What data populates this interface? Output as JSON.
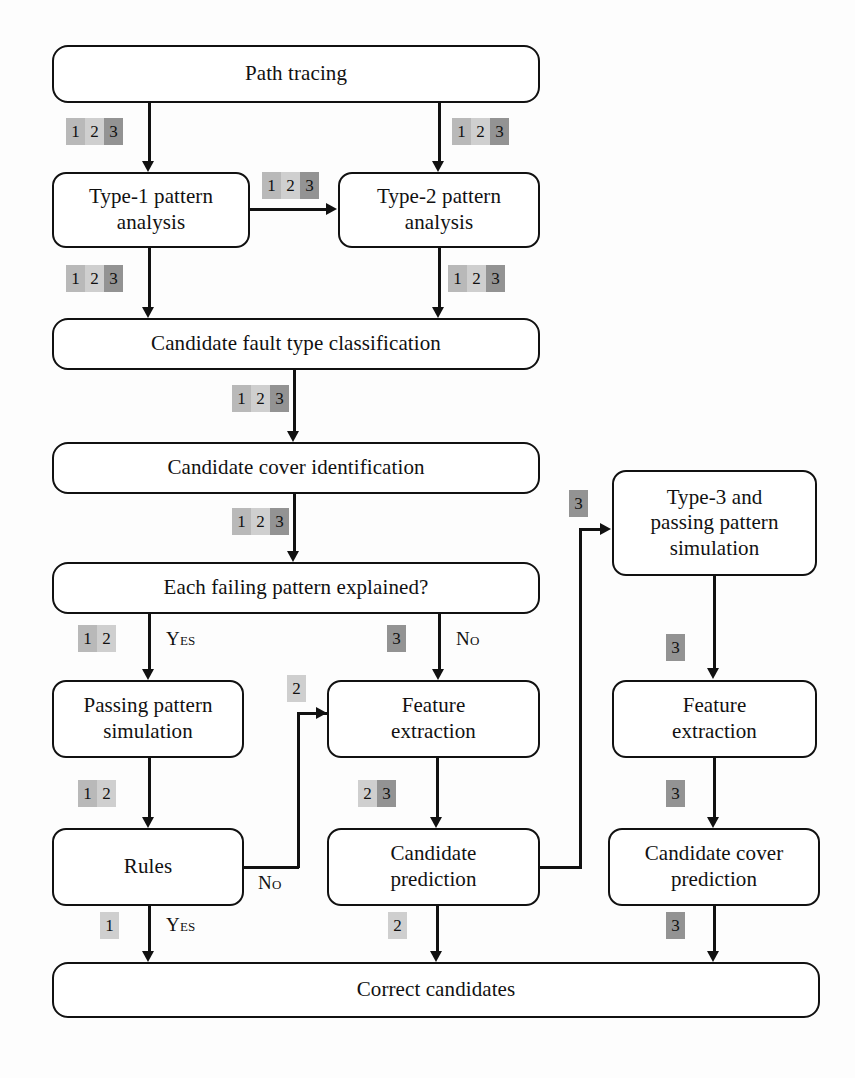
{
  "diagram": {
    "colors": {
      "badge_1": "#b9b9b9",
      "badge_2": "#cfcfcf",
      "badge_3": "#939393",
      "stroke": "#111111",
      "node_fill": "#ffffff",
      "background": "#fdfdfd"
    },
    "nodes": [
      {
        "id": "path_tracing",
        "label": "Path tracing"
      },
      {
        "id": "type1_analysis",
        "line1": "Type-1 pattern",
        "line2": "analysis"
      },
      {
        "id": "type2_analysis",
        "line1": "Type-2 pattern",
        "line2": "analysis"
      },
      {
        "id": "fault_class",
        "label": "Candidate fault type classification"
      },
      {
        "id": "cover_ident",
        "label": "Candidate cover identification"
      },
      {
        "id": "explained_q",
        "label": "Each failing pattern explained?"
      },
      {
        "id": "passing_sim",
        "line1": "Passing pattern",
        "line2": "simulation"
      },
      {
        "id": "feature_extract_mid",
        "line1": "Feature",
        "line2": "extraction"
      },
      {
        "id": "rules",
        "label": "Rules"
      },
      {
        "id": "cand_prediction",
        "line1": "Candidate",
        "line2": "prediction"
      },
      {
        "id": "type3_sim",
        "line1": "Type-3 and",
        "line2": "passing pattern",
        "line3": "simulation"
      },
      {
        "id": "feature_extract_right",
        "line1": "Feature",
        "line2": "extraction"
      },
      {
        "id": "cand_cover_pred",
        "line1": "Candidate cover",
        "line2": "prediction"
      },
      {
        "id": "correct_cands",
        "label": "Correct candidates"
      }
    ],
    "badges": [
      {
        "id": "b_pt_to_t1",
        "cells": [
          "1",
          "2",
          "3"
        ]
      },
      {
        "id": "b_pt_to_t2",
        "cells": [
          "1",
          "2",
          "3"
        ]
      },
      {
        "id": "b_t1_to_t2",
        "cells": [
          "1",
          "2",
          "3"
        ]
      },
      {
        "id": "b_t1_to_fc",
        "cells": [
          "1",
          "2",
          "3"
        ]
      },
      {
        "id": "b_t2_to_fc",
        "cells": [
          "1",
          "2",
          "3"
        ]
      },
      {
        "id": "b_fc_to_ci",
        "cells": [
          "1",
          "2",
          "3"
        ]
      },
      {
        "id": "b_ci_to_q",
        "cells": [
          "1",
          "2",
          "3"
        ]
      },
      {
        "id": "b_q_yes",
        "cells": [
          "1",
          "2"
        ]
      },
      {
        "id": "b_q_no",
        "cells": [
          "3"
        ]
      },
      {
        "id": "b_rules_back",
        "cells": [
          "2"
        ]
      },
      {
        "id": "b_ps_to_rules",
        "cells": [
          "1",
          "2"
        ]
      },
      {
        "id": "b_fe_to_cp",
        "cells": [
          "2",
          "3"
        ]
      },
      {
        "id": "b_cp_back",
        "cells": [
          "3"
        ]
      },
      {
        "id": "b_t3_to_fe",
        "cells": [
          "3"
        ]
      },
      {
        "id": "b_fe_to_ccp",
        "cells": [
          "3"
        ]
      },
      {
        "id": "b_rules_yes",
        "cells": [
          "1"
        ]
      },
      {
        "id": "b_cp_out",
        "cells": [
          "2"
        ]
      },
      {
        "id": "b_ccp_out",
        "cells": [
          "3"
        ]
      }
    ],
    "edge_labels": {
      "yes_top": "Yes",
      "no_top": "No",
      "no_rules": "No",
      "yes_rules": "Yes"
    }
  }
}
